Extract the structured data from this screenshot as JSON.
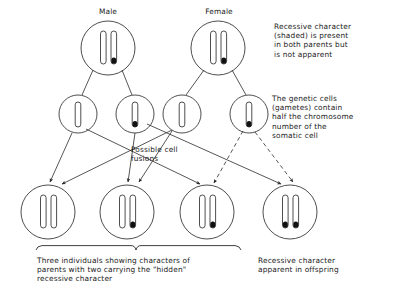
{
  "figure": {
    "title_male": "Male",
    "title_female": "Female",
    "note_parents": "Recessive character\n(shaded) is present\nin both parents but\nis not apparent",
    "note_gametes": "The genetic cells\n(gametes) contain\nhalf the chromosome\nnumber of the\nsomatic cell",
    "label_fusions": "Possible cell\nfusions",
    "caption_left": "Three individuals showing characters of\nparents with two carrying the \"hidden\"\nrecessive character",
    "caption_right": "Recessive character\napparent in offspring",
    "colors": {
      "line": "#2b2b2b",
      "chromosome_outline": "#3a3a3a",
      "chromosome_shaded": "#111111",
      "background": "#ffffff",
      "text": "#1b1b1b"
    }
  },
  "parents": [
    {
      "name": "male-parent",
      "label": "Male",
      "cx": 108,
      "cy": 48,
      "r": 27,
      "chromosomes": [
        {
          "shaded": false
        },
        {
          "shaded": true
        }
      ]
    },
    {
      "name": "female-parent",
      "label": "Female",
      "cx": 218,
      "cy": 48,
      "r": 27,
      "chromosomes": [
        {
          "shaded": false
        },
        {
          "shaded": true
        }
      ]
    }
  ],
  "gametes": [
    {
      "name": "gamete-male-dominant",
      "cx": 78,
      "cy": 114,
      "r": 19,
      "shaded": false,
      "parent": "male"
    },
    {
      "name": "gamete-male-recessive",
      "cx": 135,
      "cy": 114,
      "r": 19,
      "shaded": true,
      "parent": "male"
    },
    {
      "name": "gamete-female-dominant",
      "cx": 182,
      "cy": 114,
      "r": 19,
      "shaded": false,
      "parent": "female"
    },
    {
      "name": "gamete-female-recessive",
      "cx": 249,
      "cy": 114,
      "r": 19,
      "shaded": true,
      "parent": "female"
    }
  ],
  "offspring": [
    {
      "name": "offspring-1",
      "cx": 48,
      "cy": 212,
      "r": 27,
      "chromosomes": [
        {
          "shaded": false
        },
        {
          "shaded": false
        }
      ]
    },
    {
      "name": "offspring-2",
      "cx": 127,
      "cy": 212,
      "r": 27,
      "chromosomes": [
        {
          "shaded": false
        },
        {
          "shaded": true
        }
      ]
    },
    {
      "name": "offspring-3",
      "cx": 207,
      "cy": 212,
      "r": 27,
      "chromosomes": [
        {
          "shaded": false
        },
        {
          "shaded": true
        }
      ]
    },
    {
      "name": "offspring-4",
      "cx": 290,
      "cy": 212,
      "r": 27,
      "chromosomes": [
        {
          "shaded": true
        },
        {
          "shaded": true
        }
      ]
    }
  ],
  "fusion_arrows": [
    {
      "from": "gamete-male-dominant",
      "to": "offspring-1",
      "style": "solid"
    },
    {
      "from": "gamete-female-dominant",
      "to": "offspring-1",
      "style": "solid"
    },
    {
      "from": "gamete-male-recessive",
      "to": "offspring-2",
      "style": "solid"
    },
    {
      "from": "gamete-female-dominant",
      "to": "offspring-2",
      "style": "solid"
    },
    {
      "from": "gamete-male-dominant",
      "to": "offspring-3",
      "style": "solid"
    },
    {
      "from": "gamete-female-recessive",
      "to": "offspring-3",
      "style": "dashed"
    },
    {
      "from": "gamete-male-recessive",
      "to": "offspring-4",
      "style": "solid"
    },
    {
      "from": "gamete-female-recessive",
      "to": "offspring-4",
      "style": "dashed"
    }
  ],
  "brace": {
    "name": "offspring-brace",
    "x1": 36,
    "x2": 241,
    "y": 248,
    "tip_x": 136
  }
}
